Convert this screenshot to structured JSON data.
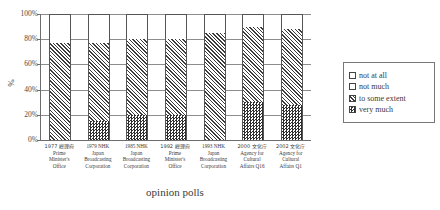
{
  "chart_data": {
    "type": "bar",
    "subtype": "stacked-100-percent",
    "title": "",
    "xlabel": "opinion polls",
    "ylabel": "%",
    "ylim": [
      0,
      100
    ],
    "yticks": [
      0,
      20,
      40,
      60,
      80,
      100
    ],
    "ytick_labels": [
      "0%",
      "20%",
      "40%",
      "60%",
      "80%",
      "100%"
    ],
    "grid": true,
    "legend_position": "right",
    "stack_order_bottom_to_top": [
      "very much",
      "to some extent",
      "not much",
      "not at all"
    ],
    "categories": [
      "1977 総理府 Prime Minister's Office",
      "1979 NHK Japan Broadcasting Corporation",
      "1985 NHK Japan Broadcasting Corporation",
      "1992 総理府 Prime Minister's Office",
      "1993 NHK Japan Broadcasting Corporation",
      "2000 文化庁 Agency for Cultural Affairs Q16",
      "2002 文化庁 Agency for Cultural Affairs Q1"
    ],
    "series": [
      {
        "name": "very much",
        "values": [
          0,
          15,
          20,
          20,
          0,
          30,
          28
        ]
      },
      {
        "name": "to some extent",
        "values": [
          77,
          62,
          60,
          60,
          85,
          60,
          60
        ]
      },
      {
        "name": "not much",
        "values": [
          23,
          23,
          20,
          20,
          15,
          10,
          12
        ]
      },
      {
        "name": "not at all",
        "values": [
          0,
          0,
          0,
          0,
          0,
          0,
          0
        ]
      }
    ]
  },
  "axis": {
    "y_unit": "%",
    "y_tick_labels": [
      "100%",
      "80%",
      "60%",
      "40%",
      "20%",
      "0%"
    ],
    "x_title": "opinion polls"
  },
  "x_categories": [
    {
      "lines": [
        "1977 総理府",
        "Prime",
        "Minister's",
        "Office"
      ],
      "jp_line_index": 0
    },
    {
      "lines": [
        "1979 NHK",
        "Japan",
        "Broadcasting",
        "Corporation"
      ],
      "jp_line_index": -1
    },
    {
      "lines": [
        "1985 NHK",
        "Japan",
        "Broadcasting",
        "Corporation"
      ],
      "jp_line_index": -1
    },
    {
      "lines": [
        "1992 総理府",
        "Prime",
        "Minister's",
        "Office"
      ],
      "jp_line_index": 0
    },
    {
      "lines": [
        "1993 NHK",
        "Japan",
        "Broadcasting",
        "Corporation"
      ],
      "jp_line_index": -1
    },
    {
      "lines": [
        "2000 文化庁",
        "Agency for",
        "Cultural",
        "Affairs Q16"
      ],
      "jp_line_index": 0
    },
    {
      "lines": [
        "2002 文化庁",
        "Agency for",
        "Cultural",
        "Affairs Q1"
      ],
      "jp_line_index": 0
    }
  ],
  "legend": {
    "items": [
      {
        "label": "not at all",
        "pattern": "solid-white"
      },
      {
        "label": "not much",
        "pattern": "dotted"
      },
      {
        "label": "to some extent",
        "pattern": "diagonal-hatch"
      },
      {
        "label": "very much",
        "pattern": "dark-checker"
      }
    ]
  },
  "colors": {
    "axis": "#6d6d6d",
    "gridline": "#8d8d8d",
    "bar_outline": "#555555",
    "text": "#3a3a3a",
    "background": "#ffffff"
  }
}
